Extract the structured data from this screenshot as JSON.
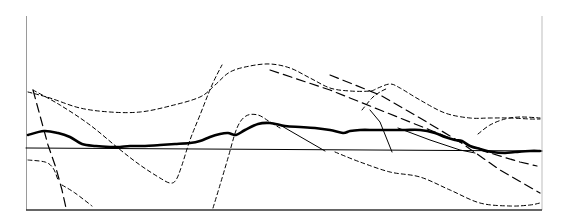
{
  "chart_data": {
    "type": "line",
    "title": "",
    "xlabel": "",
    "ylabel": "",
    "grid": false,
    "legend": null,
    "frame": {
      "left": 26,
      "right": 542,
      "top": 16,
      "bottom": 210
    },
    "baseline_y": 148,
    "series": [
      {
        "name": "thick-solid",
        "style": "solid",
        "width": 2.6,
        "color": "#000000",
        "points": [
          [
            28,
            135
          ],
          [
            44,
            131
          ],
          [
            58,
            133
          ],
          [
            70,
            137
          ],
          [
            82,
            144
          ],
          [
            96,
            146
          ],
          [
            110,
            147
          ],
          [
            120,
            147
          ],
          [
            130,
            146
          ],
          [
            145,
            146
          ],
          [
            160,
            145
          ],
          [
            175,
            144
          ],
          [
            190,
            143
          ],
          [
            200,
            141
          ],
          [
            210,
            137
          ],
          [
            220,
            134
          ],
          [
            228,
            133
          ],
          [
            236,
            135
          ],
          [
            245,
            130
          ],
          [
            258,
            124
          ],
          [
            270,
            123
          ],
          [
            285,
            126
          ],
          [
            300,
            127
          ],
          [
            315,
            128
          ],
          [
            330,
            130
          ],
          [
            343,
            133
          ],
          [
            350,
            131
          ],
          [
            360,
            130
          ],
          [
            375,
            130
          ],
          [
            390,
            130
          ],
          [
            405,
            130
          ],
          [
            420,
            130
          ],
          [
            435,
            133
          ],
          [
            445,
            137
          ],
          [
            455,
            140
          ],
          [
            462,
            141
          ],
          [
            470,
            146
          ],
          [
            480,
            149
          ],
          [
            492,
            152
          ],
          [
            505,
            153
          ],
          [
            515,
            152
          ],
          [
            530,
            151
          ],
          [
            540,
            151
          ]
        ]
      },
      {
        "name": "thin-solid-baseline",
        "style": "solid",
        "width": 1,
        "color": "#000000",
        "points": [
          [
            26,
            148
          ],
          [
            542,
            151
          ]
        ]
      },
      {
        "name": "thin-solid-a",
        "style": "solid",
        "width": 1,
        "color": "#000000",
        "points": [
          [
            280,
            125
          ],
          [
            325,
            151
          ]
        ]
      },
      {
        "name": "thin-solid-b",
        "style": "solid",
        "width": 1,
        "color": "#000000",
        "points": [
          [
            370,
            110
          ],
          [
            380,
            122
          ],
          [
            392,
            152
          ]
        ]
      },
      {
        "name": "thin-solid-c",
        "style": "solid",
        "width": 1,
        "color": "#000000",
        "points": [
          [
            398,
            128
          ],
          [
            430,
            140
          ],
          [
            460,
            150
          ],
          [
            475,
            153
          ]
        ]
      },
      {
        "name": "long-dash-steep-left",
        "style": "long-dash",
        "width": 1.2,
        "color": "#000000",
        "points": [
          [
            33,
            90
          ],
          [
            48,
            145
          ],
          [
            56,
            168
          ],
          [
            62,
            190
          ],
          [
            66,
            208
          ]
        ]
      },
      {
        "name": "long-dash-diag-1",
        "style": "long-dash",
        "width": 1.2,
        "color": "#000000",
        "points": [
          [
            270,
            70
          ],
          [
            330,
            90
          ],
          [
            380,
            110
          ],
          [
            430,
            130
          ],
          [
            480,
            150
          ],
          [
            520,
            162
          ],
          [
            537,
            166
          ]
        ]
      },
      {
        "name": "long-dash-diag-2",
        "style": "long-dash",
        "width": 1.2,
        "color": "#000000",
        "points": [
          [
            330,
            75
          ],
          [
            380,
            95
          ],
          [
            420,
            118
          ],
          [
            460,
            142
          ],
          [
            500,
            170
          ],
          [
            540,
            193
          ]
        ]
      },
      {
        "name": "short-dash-upper",
        "style": "short-dash",
        "width": 1,
        "color": "#000000",
        "points": [
          [
            28,
            92
          ],
          [
            50,
            98
          ],
          [
            80,
            108
          ],
          [
            110,
            112
          ],
          [
            140,
            112
          ],
          [
            170,
            106
          ],
          [
            200,
            97
          ],
          [
            215,
            85
          ],
          [
            230,
            72
          ],
          [
            250,
            66
          ],
          [
            270,
            64
          ],
          [
            290,
            68
          ],
          [
            310,
            78
          ],
          [
            330,
            88
          ],
          [
            350,
            91
          ],
          [
            370,
            91
          ],
          [
            378,
            88
          ],
          [
            390,
            84
          ],
          [
            400,
            88
          ],
          [
            420,
            100
          ],
          [
            445,
            113
          ],
          [
            470,
            118
          ],
          [
            490,
            118
          ],
          [
            510,
            118
          ],
          [
            530,
            119
          ],
          [
            540,
            119
          ]
        ]
      },
      {
        "name": "short-dash-s-curve",
        "style": "short-dash",
        "width": 1,
        "color": "#000000",
        "points": [
          [
            33,
            90
          ],
          [
            60,
            105
          ],
          [
            90,
            125
          ],
          [
            118,
            148
          ],
          [
            140,
            165
          ],
          [
            160,
            178
          ],
          [
            170,
            183
          ],
          [
            176,
            180
          ],
          [
            182,
            165
          ],
          [
            190,
            140
          ],
          [
            200,
            115
          ],
          [
            212,
            85
          ],
          [
            222,
            65
          ]
        ]
      },
      {
        "name": "short-dash-bump",
        "style": "short-dash",
        "width": 1,
        "color": "#000000",
        "points": [
          [
            213,
            208
          ],
          [
            220,
            185
          ],
          [
            228,
            158
          ],
          [
            237,
            128
          ],
          [
            246,
            116
          ],
          [
            258,
            115
          ],
          [
            270,
            122
          ],
          [
            280,
            128
          ]
        ]
      },
      {
        "name": "short-dash-right-rise",
        "style": "short-dash",
        "width": 1,
        "color": "#000000",
        "points": [
          [
            362,
            110
          ],
          [
            372,
            98
          ],
          [
            380,
            92
          ],
          [
            388,
            88
          ]
        ]
      },
      {
        "name": "short-dash-right-bump",
        "style": "short-dash",
        "width": 1,
        "color": "#000000",
        "points": [
          [
            478,
            134
          ],
          [
            490,
            125
          ],
          [
            505,
            119
          ],
          [
            520,
            117
          ],
          [
            540,
            118
          ]
        ]
      },
      {
        "name": "short-dash-low-left",
        "style": "short-dash",
        "width": 1,
        "color": "#000000",
        "points": [
          [
            28,
            160
          ],
          [
            45,
            162
          ],
          [
            53,
            168
          ],
          [
            58,
            180
          ]
        ]
      },
      {
        "name": "short-dash-low-left-2",
        "style": "short-dash",
        "width": 1,
        "color": "#000000",
        "points": [
          [
            62,
            185
          ],
          [
            75,
            193
          ],
          [
            92,
            206
          ]
        ]
      },
      {
        "name": "short-dash-lower-right",
        "style": "short-dash",
        "width": 1,
        "color": "#000000",
        "points": [
          [
            335,
            152
          ],
          [
            360,
            162
          ],
          [
            390,
            172
          ],
          [
            420,
            177
          ],
          [
            450,
            190
          ],
          [
            480,
            203
          ],
          [
            510,
            206
          ],
          [
            530,
            205
          ],
          [
            540,
            203
          ]
        ]
      }
    ]
  }
}
